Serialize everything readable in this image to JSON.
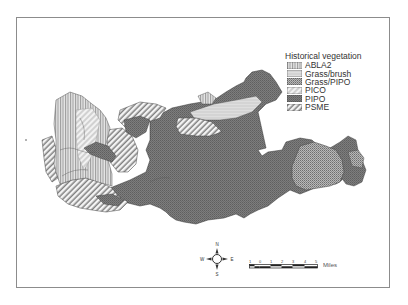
{
  "map": {
    "type": "thematic vegetation map",
    "legend": {
      "title": "Historical vegetation",
      "items": [
        {
          "label": "ABLA2",
          "pattern": "vertical-lines"
        },
        {
          "label": "Grass/brush",
          "pattern": "light-horizontal"
        },
        {
          "label": "Grass/PIPO",
          "pattern": "dense-dots"
        },
        {
          "label": "PICO",
          "pattern": "light-diagonal"
        },
        {
          "label": "PIPO",
          "pattern": "dark-crosshatch"
        },
        {
          "label": "PSME",
          "pattern": "diagonal-lines"
        }
      ]
    },
    "compass": {
      "n": "N",
      "s": "S",
      "e": "E",
      "w": "W"
    },
    "scale_bar": {
      "ticks": [
        "1",
        "0",
        "1",
        "2",
        "3",
        "4",
        "5"
      ],
      "unit": "Miles"
    }
  }
}
